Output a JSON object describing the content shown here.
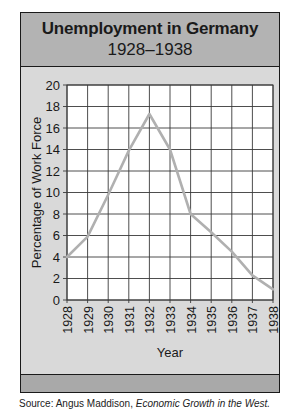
{
  "title": {
    "line1": "Unemployment in Germany",
    "line2": "1928–1938"
  },
  "source": {
    "prefix": "Source: Angus Maddison, ",
    "work": "Economic Growth in the West."
  },
  "colors": {
    "frame_border": "#1a1a1a",
    "title_band": "#b3b3b3",
    "body_background": "#d9d9d9",
    "bottom_band": "#a9a9a9",
    "plot_background": "#ffffff",
    "grid": "#3a3a3a",
    "line": "#b0b0b0"
  },
  "chart_data": {
    "type": "line",
    "title": "Unemployment in Germany 1928–1938",
    "xlabel": "Year",
    "ylabel": "Percentage of Work Force",
    "categories": [
      "1928",
      "1929",
      "1930",
      "1931",
      "1932",
      "1933",
      "1934",
      "1935",
      "1936",
      "1937",
      "1938"
    ],
    "series": [
      {
        "name": "Unemployment",
        "values": [
          4.0,
          5.9,
          9.8,
          13.9,
          17.3,
          14.0,
          8.0,
          6.3,
          4.5,
          2.3,
          1.0
        ]
      }
    ],
    "yticks": [
      0,
      2,
      4,
      6,
      8,
      10,
      12,
      14,
      16,
      18,
      20
    ],
    "ylim": [
      0,
      20
    ],
    "grid": true,
    "legend": "none",
    "source": "Source: Angus Maddison, Economic Growth in the West."
  }
}
